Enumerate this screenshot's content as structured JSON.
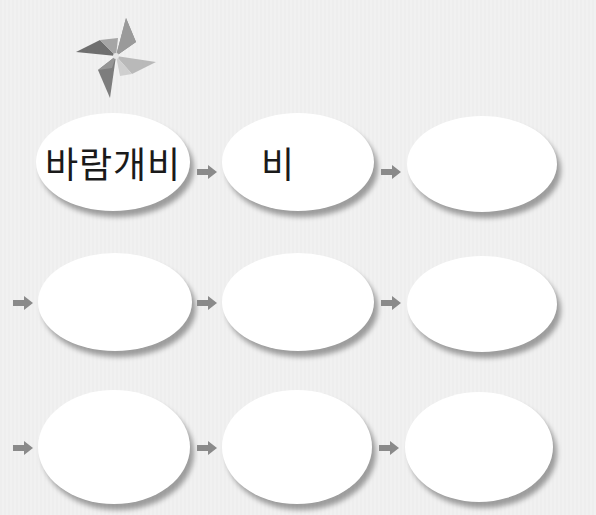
{
  "diagram": {
    "title_icon": "pinwheel-icon",
    "rows": [
      {
        "nodes": [
          {
            "label": "바람개비"
          },
          {
            "label": "비"
          },
          {
            "label": ""
          }
        ]
      },
      {
        "nodes": [
          {
            "label": ""
          },
          {
            "label": ""
          },
          {
            "label": ""
          }
        ]
      },
      {
        "nodes": [
          {
            "label": ""
          },
          {
            "label": ""
          },
          {
            "label": ""
          }
        ]
      }
    ],
    "arrow_icon": "arrow-right-icon",
    "colors": {
      "background": "#efefef",
      "node_fill": "#ffffff",
      "arrow": "#8a8a8a",
      "text": "#1a1a1a"
    }
  }
}
